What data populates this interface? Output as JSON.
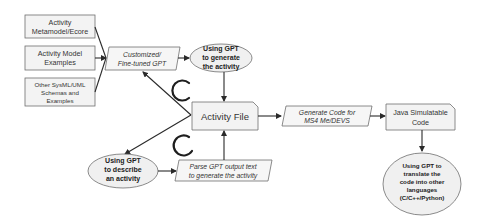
{
  "diagram": {
    "inputs": [
      {
        "id": "metamodel",
        "lines": [
          "Activity",
          "Metamodel/Ecore"
        ]
      },
      {
        "id": "model-examples",
        "lines": [
          "Activity Model",
          "Examples"
        ]
      },
      {
        "id": "sysml-schemas",
        "lines": [
          "Other SysML/UML",
          "Schemas and",
          "Examples"
        ]
      }
    ],
    "customized_gpt": {
      "lines": [
        "Customized/",
        "Fine-tuned GPT"
      ]
    },
    "generate_activity": {
      "lines": [
        "Using GPT",
        "to generate",
        "the activity"
      ]
    },
    "activity_file": {
      "label": "Activity File"
    },
    "describe_activity": {
      "lines": [
        "Using GPT",
        "to describe",
        "an activity"
      ]
    },
    "parse_output": {
      "lines": [
        "Parse GPT output text",
        "to generate the activity"
      ]
    },
    "generate_code": {
      "lines": [
        "Generate Code for",
        "MS4 Me/DEVS"
      ]
    },
    "java_code": {
      "lines": [
        "Java Simulatable",
        "Code"
      ]
    },
    "translate_code": {
      "lines": [
        "Using GPT to",
        "translate the",
        "code into other",
        "languages",
        "(C/C++/Python)"
      ]
    },
    "colors": {
      "stroke": "#6e6e6e",
      "fill": "#f3f3f3",
      "arrow": "#2a2a2a"
    }
  }
}
